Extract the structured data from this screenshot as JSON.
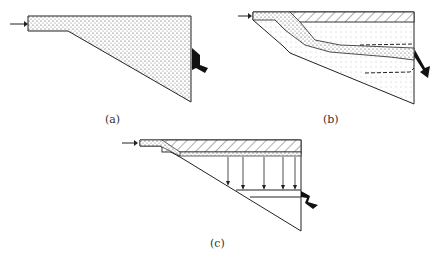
{
  "panels": [
    {
      "id": "a",
      "label": "(a)",
      "description": "Inflow enters narrow channel; whole wedge-shaped basin filled with stippled (mixed) water; outflow at right"
    },
    {
      "id": "b",
      "label": "(b)",
      "description": "Stratified basin: hatched surface layer, inflow plunges as stippled interflow layer between dashed boundaries; outflow at right"
    },
    {
      "id": "c",
      "label": "(c)",
      "description": "Inflow spreads along surface under hatched layer; settling arrows point downward; outflow at right from lower layer"
    }
  ],
  "colors": {
    "line": "#222222",
    "stipple": "#555555",
    "background": "#ffffff"
  }
}
